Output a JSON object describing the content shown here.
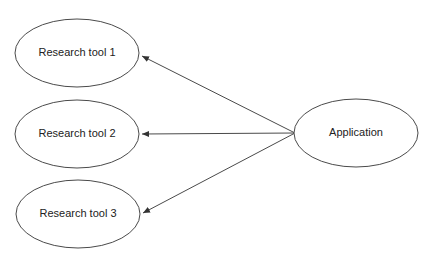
{
  "nodes": [
    {
      "id": "tool1",
      "label": "Research tool 1"
    },
    {
      "id": "tool2",
      "label": "Research tool 2"
    },
    {
      "id": "tool3",
      "label": "Research tool 3"
    },
    {
      "id": "app",
      "label": "Application"
    }
  ],
  "edges": [
    {
      "from": "app",
      "to": "tool1"
    },
    {
      "from": "app",
      "to": "tool2"
    },
    {
      "from": "app",
      "to": "tool3"
    }
  ],
  "colors": {
    "stroke": "#4a4a4a",
    "text": "#222222",
    "background": "#ffffff"
  }
}
